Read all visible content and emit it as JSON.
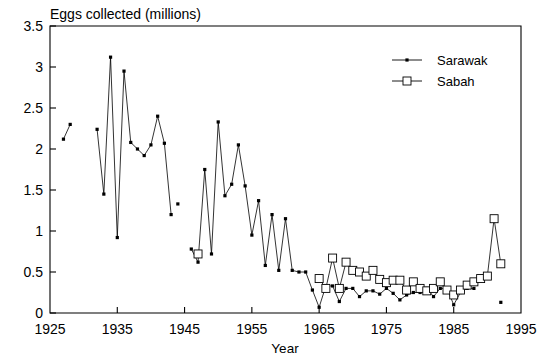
{
  "chart_data": {
    "type": "line",
    "title": "Eggs collected (millions)",
    "xlabel": "Year",
    "ylabel": "",
    "xlim": [
      1925,
      1995
    ],
    "ylim": [
      0,
      3.5
    ],
    "xticks": [
      1925,
      1935,
      1945,
      1955,
      1965,
      1975,
      1985,
      1995
    ],
    "yticks": [
      0,
      0.5,
      1,
      1.5,
      2,
      2.5,
      3,
      3.5
    ],
    "xtick_labels": [
      "1925",
      "1935",
      "1945",
      "1955",
      "1965",
      "1975",
      "1985",
      "1995"
    ],
    "ytick_labels": [
      "0",
      "0.5",
      "1",
      "1.5",
      "2",
      "2.5",
      "3",
      "3.5"
    ],
    "grid": false,
    "legend_position": "top-right",
    "series": [
      {
        "name": "Sarawak",
        "marker": "filled-dot",
        "segments": [
          {
            "x": [
              1927,
              1928
            ],
            "y": [
              2.12,
              2.3
            ]
          },
          {
            "x": [
              1932,
              1933,
              1934,
              1935,
              1936,
              1937,
              1938,
              1939,
              1940,
              1941,
              1942,
              1943
            ],
            "y": [
              2.24,
              1.45,
              3.12,
              0.92,
              2.95,
              2.08,
              2.0,
              1.92,
              2.05,
              2.4,
              2.07,
              1.2
            ]
          },
          {
            "x": [
              1944
            ],
            "y": [
              1.33
            ]
          },
          {
            "x": [
              1946,
              1947,
              1948,
              1949,
              1950,
              1951,
              1952,
              1953,
              1954,
              1955,
              1956,
              1957,
              1958,
              1959,
              1960,
              1961,
              1962,
              1963,
              1964,
              1965,
              1966,
              1967,
              1968,
              1969,
              1970,
              1971,
              1972,
              1973,
              1974,
              1975,
              1976,
              1977,
              1978,
              1979,
              1980,
              1981,
              1982,
              1983,
              1984,
              1985,
              1986,
              1987,
              1988
            ],
            "y": [
              0.78,
              0.62,
              1.75,
              0.72,
              2.33,
              1.43,
              1.57,
              2.05,
              1.55,
              0.95,
              1.37,
              0.58,
              1.2,
              0.52,
              1.15,
              0.52,
              0.5,
              0.5,
              0.28,
              0.07,
              0.33,
              0.33,
              0.14,
              0.3,
              0.3,
              0.2,
              0.27,
              0.27,
              0.23,
              0.3,
              0.24,
              0.16,
              0.22,
              0.25,
              0.25,
              0.3,
              0.2,
              0.3,
              0.3,
              0.1,
              0.25,
              0.3,
              0.3
            ]
          },
          {
            "x": [
              1992
            ],
            "y": [
              0.13
            ]
          }
        ]
      },
      {
        "name": "Sabah",
        "marker": "open-square",
        "segments": [
          {
            "x": [
              1947
            ],
            "y": [
              0.72
            ]
          },
          {
            "x": [
              1965,
              1966,
              1967,
              1968,
              1969,
              1970,
              1971,
              1972,
              1973,
              1974,
              1975,
              1976,
              1977,
              1978,
              1979,
              1980,
              1981,
              1982,
              1983,
              1984,
              1985,
              1986,
              1987,
              1988,
              1989,
              1990,
              1991,
              1992
            ],
            "y": [
              0.42,
              0.3,
              0.67,
              0.3,
              0.62,
              0.52,
              0.5,
              0.45,
              0.52,
              0.41,
              0.37,
              0.4,
              0.4,
              0.28,
              0.38,
              0.3,
              0.27,
              0.3,
              0.38,
              0.28,
              0.22,
              0.28,
              0.34,
              0.38,
              0.42,
              0.45,
              1.15,
              0.6
            ]
          }
        ]
      }
    ]
  },
  "legend": {
    "items": [
      {
        "label": "Sarawak",
        "marker": "filled-dot"
      },
      {
        "label": "Sabah",
        "marker": "open-square"
      }
    ]
  }
}
